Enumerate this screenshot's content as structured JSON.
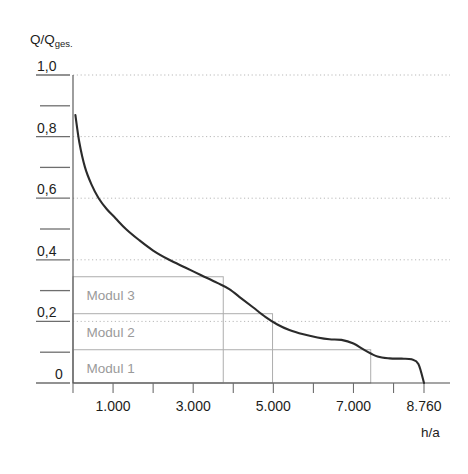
{
  "chart_data": {
    "type": "line",
    "title": "",
    "subtitle": "",
    "ylabel": "Q/Q",
    "ylabel_sub": "ges.",
    "xlabel": "h/a",
    "xlim": [
      0,
      8760
    ],
    "ylim": [
      0,
      1.0
    ],
    "grid": true,
    "legend_position": "none",
    "x_tick_values": [
      0,
      1000,
      2000,
      3000,
      4000,
      5000,
      6000,
      7000,
      8000,
      8760
    ],
    "x_tick_labels": [
      "",
      "1.000",
      "",
      "3.000",
      "",
      "5.000",
      "",
      "7.000",
      "",
      "8.760"
    ],
    "y_tick_values": [
      0,
      0.1,
      0.2,
      0.3,
      0.4,
      0.5,
      0.6,
      0.7,
      0.8,
      0.9,
      1.0
    ],
    "y_tick_labels": [
      "0",
      "",
      "0,2",
      "",
      "0,4",
      "",
      "0,6",
      "",
      "0,8",
      "",
      "1,0"
    ],
    "gridline_values": [
      1.0,
      0.8,
      0.6,
      0.4,
      0.2
    ],
    "series": [
      {
        "name": "Jahresdauerlinie",
        "color": "#2b2b2b",
        "x": [
          60,
          160,
          300,
          460,
          640,
          840,
          1060,
          1320,
          1640,
          2000,
          2400,
          2800,
          3200,
          3600,
          3900,
          4200,
          4500,
          4800,
          5100,
          5400,
          5750,
          6100,
          6400,
          6700,
          7000,
          7300,
          7600,
          7900,
          8200,
          8450,
          8620,
          8760
        ],
        "y": [
          0.87,
          0.78,
          0.7,
          0.645,
          0.6,
          0.565,
          0.535,
          0.5,
          0.465,
          0.43,
          0.4,
          0.375,
          0.35,
          0.325,
          0.305,
          0.275,
          0.245,
          0.215,
          0.19,
          0.172,
          0.158,
          0.148,
          0.142,
          0.14,
          0.128,
          0.105,
          0.086,
          0.08,
          0.079,
          0.077,
          0.062,
          0.0
        ]
      }
    ],
    "modules": [
      {
        "label": "Modul 3",
        "x_start": 0,
        "x_end": 3750,
        "y_bottom": 0.0,
        "y_top": 0.345,
        "label_x": 340,
        "label_y": 0.285
      },
      {
        "label": "Modul 2",
        "x_start": 0,
        "x_end": 4980,
        "y_bottom": 0.0,
        "y_top": 0.225,
        "label_x": 340,
        "label_y": 0.165
      },
      {
        "label": "Modul 1",
        "x_start": 0,
        "x_end": 7430,
        "y_bottom": 0.0,
        "y_top": 0.108,
        "label_x": 340,
        "label_y": 0.05
      }
    ],
    "colors": {
      "curve": "#2b2b2b",
      "grid": "#b9b9b9",
      "axis": "#4d4d4d",
      "module_box": "#adadad",
      "module_label": "#9a9a9a",
      "tick_text": "#1d1d1b"
    }
  }
}
